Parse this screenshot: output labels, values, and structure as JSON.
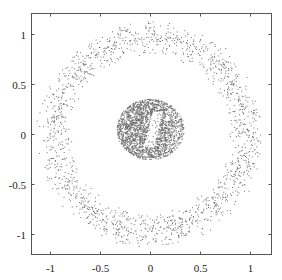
{
  "chart_data": {
    "type": "scatter",
    "title": "",
    "xlabel": "",
    "ylabel": "",
    "xlim": [
      -1.19,
      1.21
    ],
    "ylim": [
      -1.2,
      1.21
    ],
    "grid": false,
    "legend": null,
    "x_ticks": [
      -1,
      -0.5,
      0,
      0.5,
      1
    ],
    "x_tick_labels": [
      "-1",
      "-0.5",
      "0",
      "0.5",
      "1"
    ],
    "y_ticks": [
      -1,
      -0.5,
      0,
      0.5,
      1
    ],
    "y_tick_labels": [
      "-1",
      "-0.5",
      "0",
      "0.5",
      "1"
    ],
    "series": [
      {
        "name": "outer ring",
        "description": "annulus of sparse points centered at origin",
        "center": [
          0,
          0
        ],
        "r_min": 0.78,
        "r_max": 1.15,
        "count": 1600,
        "marker_color": "#000000"
      },
      {
        "name": "central cluster",
        "description": "dense blob with hollow vertical slit near center",
        "center": [
          0,
          0.05
        ],
        "r_max": 0.32,
        "count": 2200,
        "marker_color": "#000000"
      }
    ]
  },
  "frame": {
    "left_px": 31,
    "right_px": 271,
    "top_px": 13,
    "bottom_px": 254,
    "origin_px": [
      150,
      134
    ],
    "px_per_unit": 100,
    "color": "#555555"
  }
}
